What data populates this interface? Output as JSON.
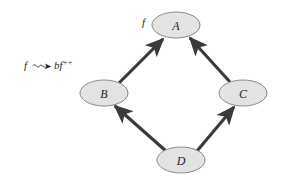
{
  "figure": {
    "kind": "directed-graph-diagram",
    "background_color": "#ffffff",
    "edge_color": "#3a3a3a",
    "node_fill": "#e3e3e3",
    "node_stroke": "#8c8c8c",
    "node_shadow": "#111111"
  },
  "nodes": [
    {
      "id": "A",
      "label": "A",
      "cx": 176,
      "cy": 25,
      "rx": 24,
      "ry": 13
    },
    {
      "id": "B",
      "label": "B",
      "cx": 104,
      "cy": 93,
      "rx": 24,
      "ry": 13
    },
    {
      "id": "C",
      "label": "C",
      "cx": 243,
      "cy": 93,
      "rx": 24,
      "ry": 13
    },
    {
      "id": "D",
      "label": "D",
      "cx": 181,
      "cy": 160,
      "rx": 24,
      "ry": 13
    }
  ],
  "edges": [
    {
      "from": "B",
      "to": "A",
      "label": ""
    },
    {
      "from": "C",
      "to": "A",
      "label": ""
    },
    {
      "from": "D",
      "to": "B",
      "label": ""
    },
    {
      "from": "D",
      "to": "C",
      "label": ""
    }
  ],
  "annotations": {
    "node_a_marker": {
      "text": "f",
      "x": 142,
      "y": 22
    },
    "rewrite_rule": {
      "lhs": "f",
      "arrow": "squiggly-arrow",
      "rhs_base": "bf",
      "rhs_superscript": "++",
      "full_text": "f ⤳ bf++",
      "x": 24,
      "y": 68
    }
  }
}
